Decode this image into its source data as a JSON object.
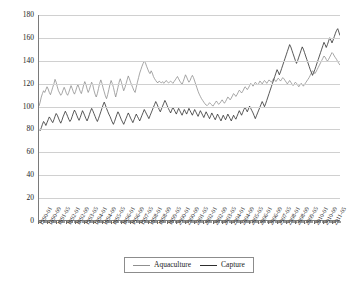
{
  "chart_data": {
    "type": "line",
    "title": "",
    "xlabel": "",
    "ylabel": "",
    "ylim": [
      0,
      180
    ],
    "ytick_step": 20,
    "yticks": [
      0,
      20,
      40,
      60,
      80,
      100,
      120,
      140,
      160,
      180
    ],
    "grid": true,
    "legend_position": "bottom-center",
    "x_start": "1990-01",
    "x_end": "2011-09",
    "x_interval": "monthly",
    "x_label_every_n_months": 8,
    "x_tick_labels": [
      "1990-01",
      "1990-09",
      "1991-05",
      "1992-01",
      "1992-09",
      "1993-05",
      "1994-01",
      "1994-09",
      "1995-05",
      "1996-01",
      "1996-09",
      "1997-05",
      "1998-01",
      "1998-09",
      "1999-05",
      "2000-01",
      "2000-09",
      "2001-05",
      "2002-01",
      "2002-09",
      "2003-05",
      "2004-01",
      "2004-09",
      "2005-05",
      "2006-01",
      "2006-09",
      "2007-05",
      "2008-01",
      "2008-09",
      "2009-05",
      "2010-01",
      "2010-09",
      "2011-05"
    ],
    "series": [
      {
        "name": "Aquaculture",
        "color": "#8f8f8f",
        "values": [
          100.0,
          103.5,
          108.0,
          111.0,
          113.5,
          112.0,
          114.5,
          117.0,
          115.0,
          112.0,
          110.0,
          113.0,
          116.5,
          119.5,
          123.5,
          121.0,
          117.0,
          113.5,
          111.5,
          109.5,
          111.0,
          114.0,
          116.5,
          114.0,
          111.0,
          109.5,
          112.0,
          115.0,
          118.0,
          115.5,
          112.5,
          110.5,
          113.0,
          116.5,
          119.0,
          116.0,
          113.0,
          111.0,
          114.5,
          118.5,
          121.5,
          119.0,
          115.0,
          112.0,
          114.5,
          118.0,
          121.0,
          118.5,
          114.0,
          110.5,
          108.0,
          111.0,
          115.5,
          120.0,
          123.0,
          120.0,
          116.0,
          112.5,
          109.0,
          106.5,
          110.0,
          114.5,
          119.0,
          122.5,
          120.0,
          116.5,
          112.0,
          108.0,
          112.0,
          116.5,
          121.0,
          124.0,
          121.0,
          117.0,
          113.5,
          116.0,
          119.5,
          123.0,
          126.5,
          124.0,
          121.0,
          118.5,
          116.0,
          113.5,
          112.0,
          116.5,
          121.0,
          125.0,
          129.0,
          132.0,
          135.0,
          137.5,
          139.5,
          138.0,
          135.0,
          132.5,
          130.0,
          128.5,
          131.0,
          129.0,
          126.0,
          124.0,
          122.5,
          121.0,
          120.5,
          122.0,
          121.0,
          120.5,
          121.5,
          120.0,
          121.0,
          122.5,
          121.5,
          120.5,
          121.0,
          122.0,
          121.0,
          120.0,
          121.5,
          123.0,
          124.5,
          126.0,
          124.0,
          122.0,
          120.5,
          119.0,
          121.5,
          124.5,
          127.5,
          125.5,
          123.0,
          121.0,
          122.5,
          125.0,
          127.0,
          125.0,
          122.0,
          119.0,
          116.0,
          113.0,
          110.5,
          108.5,
          106.5,
          105.0,
          103.5,
          102.0,
          101.0,
          100.5,
          101.5,
          103.0,
          102.0,
          101.0,
          100.0,
          101.5,
          103.0,
          104.5,
          103.0,
          101.5,
          102.5,
          104.0,
          105.5,
          104.0,
          102.5,
          104.0,
          106.0,
          108.0,
          107.0,
          105.5,
          107.0,
          109.0,
          111.0,
          110.0,
          108.5,
          110.0,
          112.0,
          114.0,
          113.0,
          111.5,
          113.0,
          115.0,
          117.0,
          116.0,
          114.5,
          116.0,
          118.0,
          120.0,
          119.0,
          117.5,
          119.0,
          121.0,
          120.0,
          118.5,
          120.0,
          122.0,
          121.0,
          119.5,
          121.0,
          122.5,
          121.5,
          120.0,
          121.5,
          123.0,
          122.0,
          121.0,
          122.5,
          124.0,
          123.0,
          121.5,
          123.0,
          124.5,
          123.5,
          122.0,
          123.5,
          125.0,
          124.0,
          122.5,
          121.0,
          119.5,
          121.0,
          122.5,
          121.0,
          119.5,
          118.0,
          119.5,
          121.0,
          120.0,
          118.5,
          117.0,
          118.5,
          120.0,
          119.0,
          117.5,
          119.0,
          120.5,
          122.0,
          123.5,
          125.0,
          127.0,
          129.0,
          131.0,
          130.0,
          128.5,
          130.0,
          132.0,
          134.0,
          136.0,
          138.0,
          140.0,
          142.0,
          144.0,
          143.0,
          141.0,
          139.5,
          141.0,
          143.0,
          145.0,
          147.0,
          146.0,
          144.0,
          142.5,
          141.0,
          139.0,
          137.5,
          136.0
        ]
      },
      {
        "name": "Capture",
        "color": "#2e2e2e",
        "values": [
          80.0,
          78.5,
          81.0,
          84.0,
          86.5,
          85.0,
          83.0,
          85.5,
          88.0,
          90.5,
          89.0,
          87.0,
          85.5,
          88.0,
          91.0,
          93.5,
          92.0,
          89.5,
          87.0,
          85.0,
          87.5,
          90.5,
          93.0,
          95.5,
          93.5,
          91.0,
          88.5,
          86.5,
          88.0,
          91.0,
          94.0,
          96.5,
          94.5,
          92.0,
          89.5,
          87.5,
          90.0,
          93.0,
          96.0,
          94.0,
          91.5,
          89.0,
          87.0,
          89.5,
          92.5,
          95.5,
          98.0,
          96.0,
          93.5,
          91.0,
          88.5,
          86.5,
          89.0,
          92.0,
          95.0,
          98.0,
          101.0,
          103.5,
          101.0,
          98.0,
          95.5,
          93.0,
          91.0,
          88.5,
          86.0,
          84.0,
          86.5,
          89.5,
          92.5,
          95.0,
          93.0,
          90.5,
          88.0,
          86.0,
          84.0,
          86.5,
          89.0,
          91.5,
          94.0,
          92.0,
          89.5,
          87.5,
          85.5,
          88.0,
          90.5,
          93.0,
          91.0,
          89.0,
          87.0,
          89.5,
          92.0,
          94.5,
          97.0,
          95.0,
          93.0,
          91.0,
          89.0,
          91.5,
          94.0,
          96.5,
          99.0,
          101.5,
          104.0,
          102.0,
          99.5,
          97.0,
          95.0,
          97.5,
          100.0,
          102.5,
          105.0,
          103.0,
          100.5,
          98.0,
          96.0,
          94.0,
          96.5,
          99.0,
          97.0,
          95.0,
          93.0,
          95.5,
          98.0,
          96.0,
          94.0,
          92.0,
          94.5,
          97.0,
          95.0,
          93.0,
          95.5,
          98.0,
          96.0,
          94.0,
          92.0,
          94.5,
          97.0,
          95.0,
          93.0,
          91.0,
          93.5,
          96.0,
          94.0,
          92.0,
          90.0,
          92.5,
          95.0,
          93.0,
          91.0,
          89.0,
          91.5,
          94.0,
          92.0,
          90.0,
          88.0,
          90.5,
          93.0,
          91.0,
          89.0,
          87.0,
          89.5,
          92.0,
          90.0,
          88.0,
          90.5,
          93.0,
          91.0,
          89.0,
          87.0,
          89.5,
          92.0,
          90.0,
          88.5,
          91.0,
          93.5,
          96.0,
          94.0,
          92.0,
          94.5,
          97.0,
          99.0,
          97.0,
          95.0,
          97.5,
          100.0,
          98.0,
          96.0,
          94.0,
          91.5,
          89.0,
          91.5,
          94.0,
          96.5,
          99.0,
          101.5,
          104.0,
          102.0,
          99.5,
          102.0,
          105.0,
          108.0,
          111.0,
          114.0,
          117.0,
          120.0,
          123.0,
          126.0,
          129.0,
          132.0,
          130.0,
          127.5,
          130.0,
          133.0,
          136.0,
          139.0,
          142.0,
          145.0,
          148.0,
          151.0,
          154.0,
          152.0,
          149.0,
          146.0,
          143.0,
          140.0,
          137.5,
          140.0,
          143.0,
          146.0,
          149.0,
          152.0,
          150.0,
          147.0,
          144.0,
          141.0,
          138.0,
          135.0,
          132.0,
          129.5,
          127.0,
          129.5,
          132.0,
          135.0,
          138.0,
          141.0,
          144.0,
          147.0,
          150.0,
          153.0,
          156.0,
          154.0,
          151.5,
          154.0,
          157.0,
          160.0,
          158.0,
          155.5,
          158.0,
          161.0,
          164.0,
          166.5,
          168.0,
          165.0,
          162.0
        ]
      }
    ]
  },
  "legend": {
    "entries": [
      {
        "label": "Aquaculture",
        "color": "#8f8f8f"
      },
      {
        "label": "Capture",
        "color": "#2e2e2e"
      }
    ]
  }
}
